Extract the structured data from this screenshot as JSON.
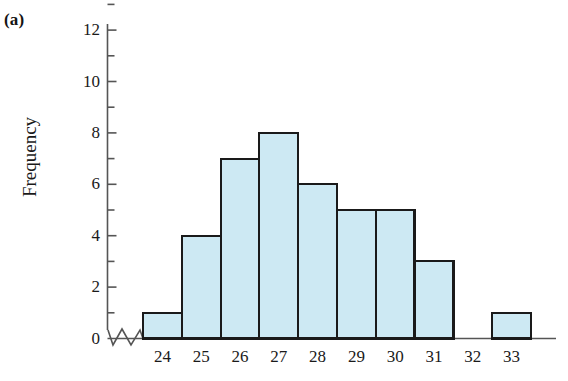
{
  "panel": {
    "label": "(a)"
  },
  "chart_data": {
    "type": "bar",
    "title": "",
    "subtitle": "",
    "xlabel": "",
    "ylabel": "Frequency",
    "categories": [
      "24",
      "25",
      "26",
      "27",
      "28",
      "29",
      "30",
      "31",
      "32",
      "33"
    ],
    "values": [
      1,
      4,
      7,
      8,
      6,
      5,
      5,
      3,
      0,
      1
    ],
    "series": [
      {
        "name": "Frequency",
        "values": [
          1,
          4,
          7,
          8,
          6,
          5,
          5,
          3,
          0,
          1
        ]
      }
    ],
    "ylim": [
      0,
      13
    ],
    "ytick_labels": [
      "0",
      "2",
      "4",
      "6",
      "8",
      "10",
      "12"
    ],
    "ytick_values": [
      0,
      2,
      4,
      6,
      8,
      10,
      12
    ],
    "yminor_values": [
      1,
      3,
      5,
      7,
      9,
      11,
      13
    ],
    "xtick_labels": [
      "24",
      "25",
      "26",
      "27",
      "28",
      "29",
      "30",
      "31",
      "32",
      "33"
    ],
    "grid": false,
    "legend": false,
    "legend_position": "none",
    "axis_break": true,
    "annotations": [],
    "colors": {
      "bar_fill": "#cde9f3",
      "bar_edge": "#1a1a1a",
      "axis": "#555555",
      "text": "#1a1a1a",
      "background": "#ffffff"
    }
  }
}
